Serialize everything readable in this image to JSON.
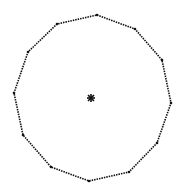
{
  "figure": {
    "width": 184,
    "height": 196,
    "background": "#ffffff",
    "shape": "dodecagon",
    "stroke_color": "#111111",
    "vertices": [
      [
        97,
        15
      ],
      [
        135,
        29
      ],
      [
        162,
        60
      ],
      [
        171,
        103
      ],
      [
        157,
        143
      ],
      [
        129,
        172
      ],
      [
        89,
        181
      ],
      [
        51,
        167
      ],
      [
        23,
        135
      ],
      [
        14,
        93
      ],
      [
        28,
        52
      ],
      [
        57,
        24
      ]
    ],
    "center_mark": {
      "x": 91,
      "y": 98,
      "glyph": "star-icon"
    }
  }
}
